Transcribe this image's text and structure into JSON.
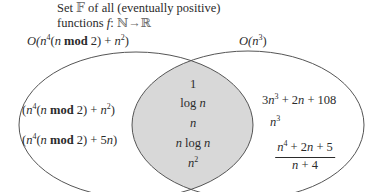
{
  "title": {
    "line1_prefix": "Set ",
    "family_symbol": "𝔽",
    "line1_suffix": " of all (eventually positive)",
    "line2_prefix": "functions ",
    "function_name": "f",
    "colon": ": ",
    "domain_set": "ℕ",
    "arrow": "→",
    "codomain_set": "ℝ"
  },
  "sets": {
    "left": {
      "label_parts": [
        "O(",
        "n",
        "4",
        "(",
        "n",
        " mod",
        " 2) + ",
        "n",
        "2",
        ")"
      ],
      "items": [
        {
          "parts": [
            "(",
            "n",
            "4",
            "(",
            "n",
            " mod",
            " 2) + ",
            "n",
            "2",
            ")"
          ]
        },
        {
          "parts": [
            "(",
            "n",
            "4",
            "(",
            "n",
            " mod",
            " 2) + 5",
            "n",
            ")"
          ]
        }
      ]
    },
    "right": {
      "label_parts": [
        "O(",
        "n",
        "3",
        ")"
      ],
      "items": [
        {
          "parts": [
            "3",
            "n",
            "3",
            " + 2",
            "n",
            " + 108"
          ]
        },
        {
          "parts": [
            "n",
            "3"
          ]
        },
        {
          "fraction": {
            "numerator_parts": [
              "n",
              "4",
              " + 2",
              "n",
              " + 5"
            ],
            "denominator_parts": [
              "n",
              " + 4"
            ]
          }
        }
      ]
    },
    "intersection": {
      "items": [
        {
          "parts": [
            "1"
          ]
        },
        {
          "parts": [
            "log ",
            "n"
          ]
        },
        {
          "parts": [
            "n"
          ]
        },
        {
          "parts": [
            "n",
            " log ",
            "n"
          ]
        },
        {
          "parts": [
            "n",
            "2"
          ]
        }
      ]
    }
  },
  "colors": {
    "stroke": "#555555",
    "intersection_fill": "#d8d8d8",
    "text": "#2b2b2b",
    "double_struck": "#6a6a6a"
  }
}
